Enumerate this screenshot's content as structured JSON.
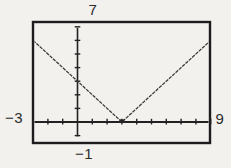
{
  "figure": {
    "background": "#f2f1ee",
    "ink": "#222222",
    "curve_color": "#3a3a3a"
  },
  "chart_data": {
    "type": "line",
    "title": "",
    "xlabel": "",
    "ylabel": "",
    "series": [
      {
        "name": "y = |x - 3|",
        "points": [
          [
            -3,
            6
          ],
          [
            3,
            0
          ],
          [
            9,
            6
          ]
        ]
      }
    ],
    "xlim": [
      -3,
      9
    ],
    "ylim": [
      -1,
      7
    ],
    "xscl": 1,
    "yscl": 1,
    "grid": false,
    "legend": "none",
    "window_labels": {
      "ymax": "7",
      "xmin": "−3",
      "xmax": "9",
      "ymin": "−1"
    }
  }
}
